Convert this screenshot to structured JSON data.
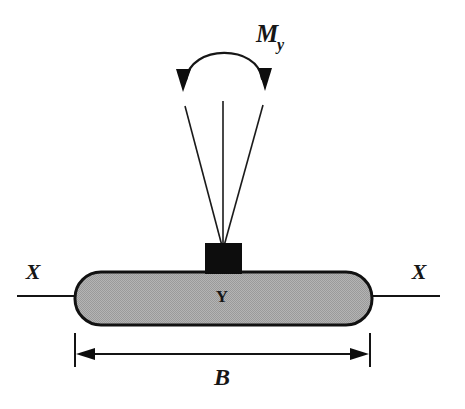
{
  "figure": {
    "background_color": "#ffffff"
  },
  "labels": {
    "moment_symbol": "M",
    "moment_subscript": "y",
    "axis_left": "X",
    "axis_right": "X",
    "footing_label": "Y",
    "width_dimension": "B"
  },
  "colors": {
    "ink": "#141414",
    "footing_fill": "#a9a9a9",
    "footing_edge": "#111111",
    "column_fill": "#0d0d0d",
    "background": "#ffffff"
  },
  "elements": {
    "moment_arc": {
      "name": "curved double-headed moment arrow",
      "direction": "both-ends-down",
      "apex_y": 38,
      "left_tip": [
        183,
        90
      ],
      "right_tip": [
        265,
        89
      ]
    },
    "load_fan": {
      "name": "three converging load lines",
      "count": 3,
      "apex": [
        223,
        246
      ],
      "tops": [
        [
          185,
          106
        ],
        [
          223,
          101
        ],
        [
          263,
          105
        ]
      ]
    },
    "column": {
      "name": "column stub",
      "x": 205,
      "y": 243,
      "width": 37,
      "height": 30
    },
    "footing": {
      "name": "rounded footing pad",
      "x": 75,
      "y": 272,
      "width": 297,
      "height": 53,
      "corner_radius": 26
    },
    "axis_line": {
      "name": "X-X section axis",
      "y": 296,
      "left_start": 17,
      "right_end": 440
    },
    "dimension": {
      "name": "width dimension B",
      "y": 354,
      "left": 75,
      "right": 370,
      "extension_top": 333,
      "extension_bottom": 366
    }
  }
}
